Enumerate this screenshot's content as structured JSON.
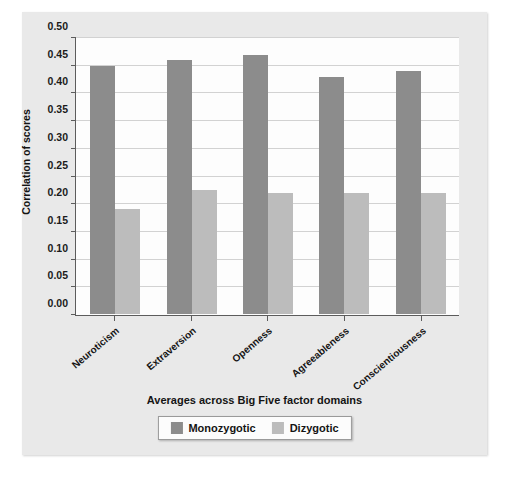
{
  "chart_data": {
    "type": "bar",
    "title": "",
    "xlabel": "Averages across Big Five factor domains",
    "ylabel": "Correlation of scores",
    "categories": [
      "Neuroticism",
      "Extraversion",
      "Openness",
      "Agreeableness",
      "Conscientiousness"
    ],
    "series": [
      {
        "name": "Monozygotic",
        "color": "#8c8c8c",
        "values": [
          0.45,
          0.46,
          0.47,
          0.43,
          0.44
        ]
      },
      {
        "name": "Dizygotic",
        "color": "#bcbcbc",
        "values": [
          0.19,
          0.225,
          0.22,
          0.22,
          0.22
        ]
      }
    ],
    "ylim": [
      0.0,
      0.5
    ],
    "yticks": [
      "0.00",
      "0.05",
      "0.10",
      "0.15",
      "0.20",
      "0.25",
      "0.30",
      "0.35",
      "0.40",
      "0.45",
      "0.50"
    ],
    "ytick_values": [
      0.0,
      0.05,
      0.1,
      0.15,
      0.2,
      0.25,
      0.3,
      0.35,
      0.4,
      0.45,
      0.5
    ],
    "grid": true,
    "legend_position": "bottom-center",
    "legend_entries": [
      "Monozygotic",
      "Dizygotic"
    ]
  }
}
